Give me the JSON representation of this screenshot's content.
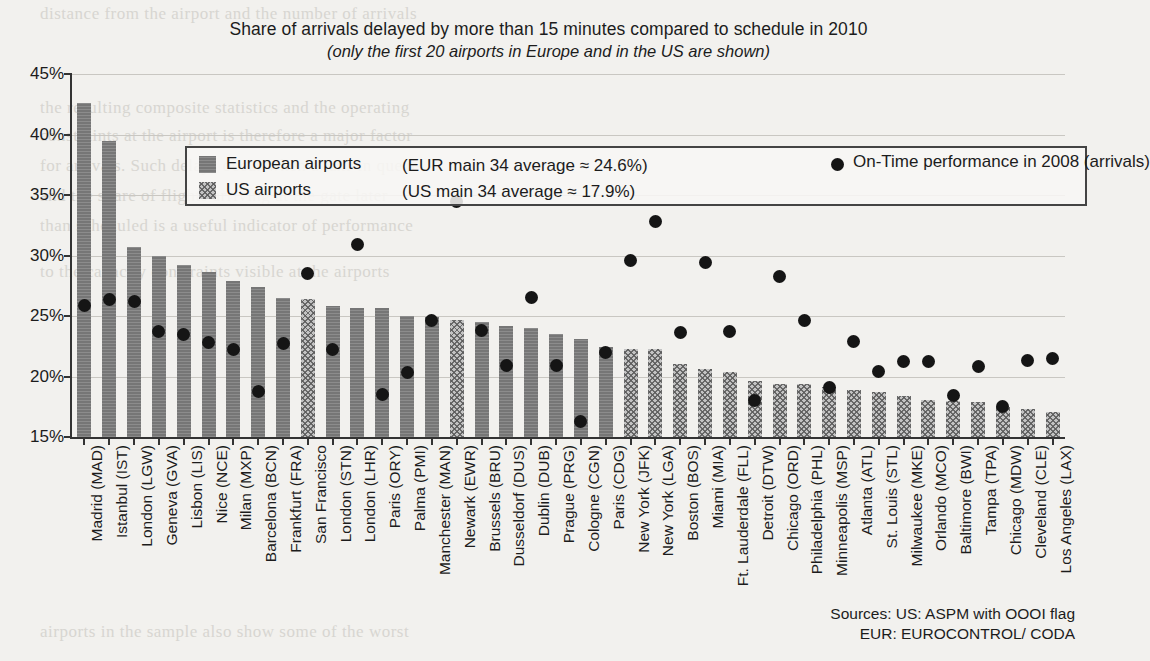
{
  "title": "Share of arrivals delayed by more than 15 minutes compared to schedule in 2010",
  "subtitle": "(only the first 20 airports in Europe and in the US are shown)",
  "legend": {
    "eu_label": "European airports",
    "us_label": "US airports",
    "eu_average": "(EUR main 34 average ≈ 24.6%)",
    "us_average": "(US main 34 average ≈ 17.9%)",
    "dot_label": "On-Time performance in 2008 (arrivals)"
  },
  "sources": {
    "line1": "Sources:  US: ASPM with OOOI flag",
    "line2": "EUR: EUROCONTROL/ CODA"
  },
  "colors": {
    "eu_bar": "#767676",
    "us_bar": "#c3c3c3",
    "dot": "#151515",
    "grid": "#c9c7c2",
    "axis": "#333333",
    "page": "#f2f1ee"
  },
  "chart_data": {
    "type": "bar",
    "title": "Share of arrivals delayed by more than 15 minutes compared to schedule in 2010",
    "subtitle": "(only the first 20 airports in Europe and in the US are shown)",
    "xlabel": "",
    "ylabel": "",
    "ylim": [
      15,
      45
    ],
    "yticks": [
      15,
      20,
      25,
      30,
      35,
      40,
      45
    ],
    "ytick_labels": [
      "15%",
      "20%",
      "25%",
      "30%",
      "35%",
      "40%",
      "45%"
    ],
    "grid": true,
    "legend_position": "top-inside",
    "categories": [
      "Madrid (MAD)",
      "Istanbul (IST)",
      "London (LGW)",
      "Geneva (GVA)",
      "Lisbon (LIS)",
      "Nice (NCE)",
      "Milan (MXP)",
      "Barcelona (BCN)",
      "Frankfurt (FRA)",
      "San Francisco",
      "London (STN)",
      "London (LHR)",
      "Paris (ORY)",
      "Palma (PMI)",
      "Manchester (MAN)",
      "Newark (EWR)",
      "Brussels (BRU)",
      "Dusseldorf (DUS)",
      "Dublin (DUB)",
      "Prague (PRG)",
      "Cologne (CGN)",
      "Paris (CDG)",
      "New York (JFK)",
      "New York (LGA)",
      "Boston (BOS)",
      "Miami (MIA)",
      "Ft. Lauderdale (FLL)",
      "Detroit (DTW)",
      "Chicago (ORD)",
      "Philadelphia (PHL)",
      "Minneapolis (MSP)",
      "Atlanta (ATL)",
      "St. Louis (STL)",
      "Milwaukee (MKE)",
      "Orlando (MCO)",
      "Baltimore (BWI)",
      "Tampa (TPA)",
      "Chicago (MDW)",
      "Cleveland (CLE)",
      "Los Angeles (LAX)"
    ],
    "region": [
      "EU",
      "EU",
      "EU",
      "EU",
      "EU",
      "EU",
      "EU",
      "EU",
      "EU",
      "US",
      "EU",
      "EU",
      "EU",
      "EU",
      "EU",
      "US",
      "EU",
      "EU",
      "EU",
      "EU",
      "EU",
      "EU",
      "US",
      "US",
      "US",
      "US",
      "US",
      "US",
      "US",
      "US",
      "US",
      "US",
      "US",
      "US",
      "US",
      "US",
      "US",
      "US",
      "US",
      "US"
    ],
    "series": [
      {
        "name": "Share of arrivals delayed by more than 15 minutes (2010)",
        "kind": "bar",
        "values": [
          42.6,
          39.5,
          30.7,
          30.0,
          29.2,
          28.6,
          27.9,
          27.4,
          26.5,
          26.4,
          25.8,
          25.7,
          25.7,
          25.0,
          24.9,
          24.7,
          24.5,
          24.2,
          24.0,
          23.5,
          23.1,
          22.4,
          22.3,
          22.3,
          21.0,
          20.6,
          20.4,
          19.6,
          19.4,
          19.4,
          19.1,
          18.9,
          18.7,
          18.4,
          18.1,
          18.0,
          17.9,
          17.5,
          17.3,
          17.1
        ]
      },
      {
        "name": "On-Time performance in 2008 (arrivals)",
        "kind": "scatter",
        "values": [
          25.9,
          26.4,
          26.2,
          23.7,
          23.5,
          22.8,
          22.2,
          18.8,
          22.7,
          28.5,
          22.2,
          30.9,
          18.5,
          20.3,
          24.6,
          34.5,
          23.8,
          20.9,
          26.5,
          20.9,
          16.3,
          22.0,
          29.6,
          32.8,
          23.6,
          29.4,
          23.7,
          18.0,
          28.3,
          24.6,
          19.1,
          22.9,
          20.4,
          21.2,
          21.2,
          18.4,
          20.8,
          17.5,
          21.3,
          21.5
        ]
      }
    ]
  }
}
